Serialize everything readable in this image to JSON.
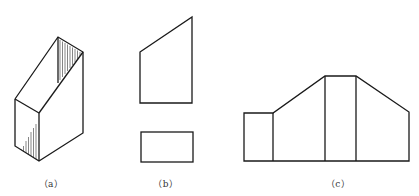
{
  "figure": {
    "panels": [
      {
        "id": "a",
        "label": "（a）",
        "description": "Isometric view of a prism with sloped top face and hatched faces"
      },
      {
        "id": "b",
        "label": "（b）",
        "description": "Two orthographic views: trapezoid front view and rectangular top view"
      },
      {
        "id": "c",
        "label": "（c）",
        "description": "Development (unfolded) view of the prism's lateral faces"
      }
    ]
  },
  "colors": {
    "line": "#1a1a1a",
    "background": "#ffffff",
    "label": "#333333"
  }
}
